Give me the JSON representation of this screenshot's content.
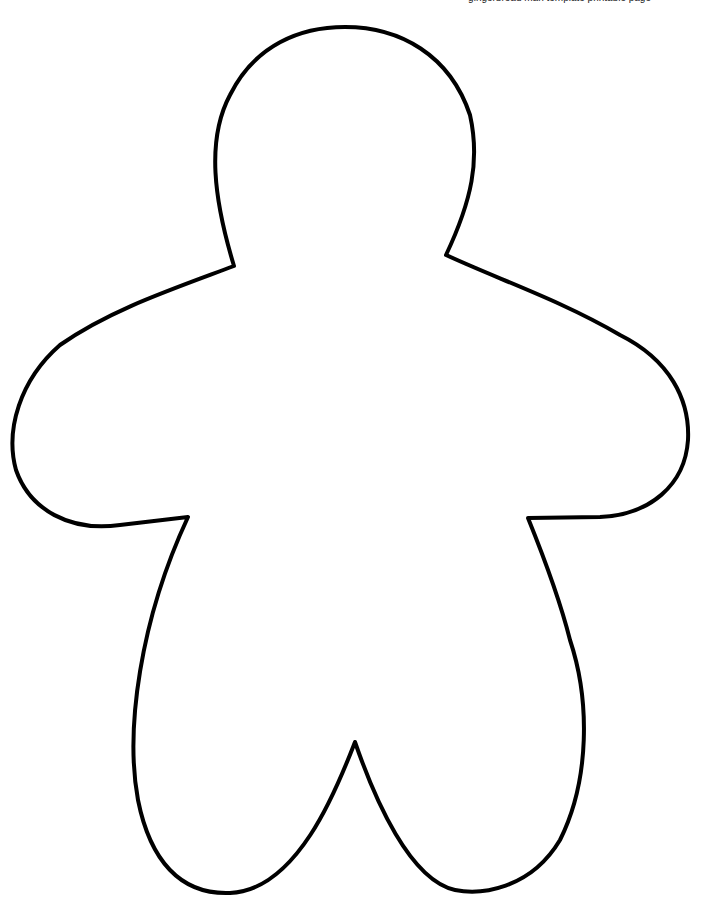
{
  "page": {
    "caption": "gingerbread man template printable page",
    "background": "#ffffff"
  },
  "figure": {
    "stroke_color": "#000000",
    "fill_color": "#ffffff",
    "stroke_width": 4
  }
}
